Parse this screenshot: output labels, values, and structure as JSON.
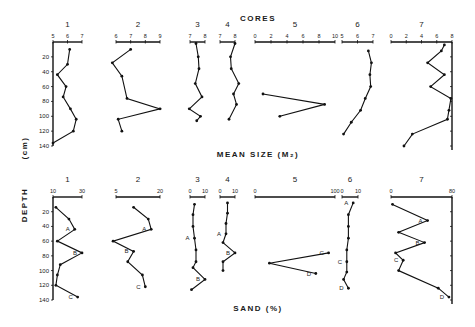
{
  "chart_data": [
    {
      "type": "line",
      "panel": "mean-size",
      "title": "CORES",
      "xlabel": "MEAN SIZE (M₂)",
      "ylabel": "DEPTH (cm)",
      "ylim": [
        0,
        140
      ],
      "yticks": [
        "20",
        "40",
        "60",
        "80",
        "100",
        "120",
        "140"
      ],
      "grid": false,
      "cores": [
        {
          "name": "1",
          "xlim": [
            5,
            7
          ],
          "xticks": [
            "5",
            "6",
            "7"
          ],
          "points": [
            [
              6.15,
              10
            ],
            [
              6.0,
              30
            ],
            [
              5.3,
              44
            ],
            [
              5.9,
              60
            ],
            [
              5.7,
              74
            ],
            [
              6.2,
              90
            ],
            [
              6.6,
              104
            ],
            [
              6.4,
              120
            ],
            [
              5.0,
              136
            ]
          ]
        },
        {
          "name": "2",
          "xlim": [
            6,
            9
          ],
          "xticks": [
            "6",
            "7",
            "8",
            "9"
          ],
          "points": [
            [
              7.0,
              10
            ],
            [
              5.75,
              28
            ],
            [
              6.4,
              46
            ],
            [
              6.75,
              76
            ],
            [
              9.0,
              90
            ],
            [
              6.15,
              104
            ],
            [
              6.4,
              120
            ]
          ]
        },
        {
          "name": "3",
          "xlim": [
            7,
            8
          ],
          "xticks": [
            "7",
            "8"
          ],
          "points": [
            [
              7.4,
              2
            ],
            [
              7.55,
              20
            ],
            [
              7.6,
              36
            ],
            [
              7.35,
              56
            ],
            [
              7.8,
              74
            ],
            [
              6.95,
              90
            ],
            [
              7.7,
              100
            ],
            [
              7.45,
              106
            ]
          ]
        },
        {
          "name": "4",
          "xlim": [
            7,
            8
          ],
          "xticks": [
            "7",
            "8"
          ],
          "points": [
            [
              8.0,
              2
            ],
            [
              7.7,
              20
            ],
            [
              7.75,
              36
            ],
            [
              8.25,
              56
            ],
            [
              7.9,
              70
            ],
            [
              8.1,
              84
            ],
            [
              7.6,
              104
            ]
          ]
        },
        {
          "name": "5",
          "xlim": [
            0,
            10
          ],
          "xticks": [
            "0",
            "2",
            "4",
            "6",
            "8",
            "10"
          ],
          "points": [
            [
              1.0,
              70
            ],
            [
              8.7,
              84
            ],
            [
              3.1,
              100
            ]
          ]
        },
        {
          "name": "6",
          "xlim": [
            5,
            7
          ],
          "xticks": [
            "5",
            "6",
            "7"
          ],
          "points": [
            [
              6.7,
              12
            ],
            [
              6.9,
              28
            ],
            [
              6.8,
              44
            ],
            [
              6.85,
              60
            ],
            [
              6.5,
              76
            ],
            [
              6.2,
              92
            ],
            [
              5.6,
              108
            ],
            [
              5.1,
              124
            ]
          ]
        },
        {
          "name": "7",
          "xlim": [
            0,
            8
          ],
          "xticks": [
            "0",
            "2",
            "4",
            "6",
            "8"
          ],
          "points": [
            [
              7.0,
              4
            ],
            [
              6.6,
              12
            ],
            [
              4.8,
              28
            ],
            [
              7.0,
              44
            ],
            [
              5.2,
              60
            ],
            [
              7.85,
              76
            ],
            [
              7.6,
              92
            ],
            [
              7.4,
              104
            ],
            [
              2.8,
              124
            ],
            [
              1.7,
              140
            ]
          ]
        }
      ]
    },
    {
      "type": "line",
      "panel": "sand",
      "title": "",
      "xlabel": "SAND (%)",
      "ylabel": "DEPTH (cm)",
      "ylim": [
        0,
        140
      ],
      "yticks": [
        "20",
        "40",
        "60",
        "80",
        "100",
        "120",
        "140"
      ],
      "grid": false,
      "cores": [
        {
          "name": "1",
          "xlim": [
            10,
            30
          ],
          "xticks": [
            "10",
            "30"
          ],
          "points": [
            [
              12,
              14
            ],
            [
              21,
              30
            ],
            [
              25,
              44
            ],
            [
              13,
              60
            ],
            [
              30,
              76
            ],
            [
              15,
              92
            ],
            [
              13,
              106
            ],
            [
              12,
              120
            ],
            [
              27,
              136
            ]
          ],
          "labels": [
            {
              "text": "A",
              "point": 2
            },
            {
              "text": "B",
              "point": 4
            },
            {
              "text": "C",
              "point": 8
            }
          ]
        },
        {
          "name": "2",
          "xlim": [
            5,
            20
          ],
          "xticks": [
            "5",
            "20"
          ],
          "points": [
            [
              11,
              14
            ],
            [
              16,
              30
            ],
            [
              17,
              44
            ],
            [
              4,
              60
            ],
            [
              11,
              74
            ],
            [
              9,
              88
            ],
            [
              14,
              106
            ],
            [
              15,
              122
            ]
          ],
          "labels": [
            {
              "text": "A",
              "point": 2
            },
            {
              "text": "B",
              "point": 4
            },
            {
              "text": "C",
              "point": 7
            }
          ]
        },
        {
          "name": "3",
          "xlim": [
            0,
            10
          ],
          "xticks": [
            "0",
            "10"
          ],
          "points": [
            [
              3,
              10
            ],
            [
              2,
              24
            ],
            [
              2,
              40
            ],
            [
              3,
              56
            ],
            [
              4,
              72
            ],
            [
              4,
              88
            ],
            [
              2,
              96
            ],
            [
              10,
              112
            ],
            [
              1,
              126
            ]
          ],
          "labels": [
            {
              "text": "A",
              "point": 3
            },
            {
              "text": "B",
              "point": 7
            }
          ]
        },
        {
          "name": "4",
          "xlim": [
            0,
            10
          ],
          "xticks": [
            "0",
            "10"
          ],
          "points": [
            [
              5,
              8
            ],
            [
              5,
              22
            ],
            [
              4,
              36
            ],
            [
              4,
              50
            ],
            [
              2,
              62
            ],
            [
              10,
              76
            ],
            [
              2,
              88
            ],
            [
              2,
              100
            ]
          ],
          "labels": [
            {
              "text": "A",
              "point": 3
            },
            {
              "text": "B",
              "point": 5
            }
          ]
        },
        {
          "name": "5",
          "xlim": [
            0,
            100
          ],
          "xticks": [
            "0",
            "100"
          ],
          "points": [
            [
              92,
              76
            ],
            [
              18,
              90
            ],
            [
              76,
              104
            ]
          ],
          "labels": [
            {
              "text": "C",
              "point": 0
            },
            {
              "text": "D",
              "point": 2
            }
          ]
        },
        {
          "name": "6",
          "xlim": [
            0,
            10
          ],
          "xticks": [
            "0",
            "10"
          ],
          "points": [
            [
              7,
              8
            ],
            [
              4,
              24
            ],
            [
              4,
              40
            ],
            [
              4,
              56
            ],
            [
              3,
              72
            ],
            [
              3,
              88
            ],
            [
              3,
              102
            ],
            [
              1,
              112
            ],
            [
              4,
              124
            ]
          ],
          "labels": [
            {
              "text": "A",
              "point": 0
            },
            {
              "text": "C",
              "point": 5
            },
            {
              "text": "D",
              "point": 8
            }
          ]
        },
        {
          "name": "7",
          "xlim": [
            0,
            80
          ],
          "xticks": [
            "0",
            "80"
          ],
          "points": [
            [
              2,
              10
            ],
            [
              48,
              32
            ],
            [
              10,
              48
            ],
            [
              44,
              62
            ],
            [
              6,
              76
            ],
            [
              16,
              86
            ],
            [
              10,
              100
            ],
            [
              62,
              124
            ],
            [
              76,
              136
            ]
          ],
          "labels": [
            {
              "text": "A",
              "point": 1
            },
            {
              "text": "B",
              "point": 3
            },
            {
              "text": "C",
              "point": 5
            },
            {
              "text": "D",
              "point": 8
            }
          ]
        }
      ]
    }
  ],
  "labels": {
    "cores_title": "CORES",
    "depth_label": "DEPTH",
    "unit_label": "(cm)",
    "top_xlabel": "MEAN SIZE (M₂)",
    "bottom_xlabel": "SAND (%)"
  }
}
